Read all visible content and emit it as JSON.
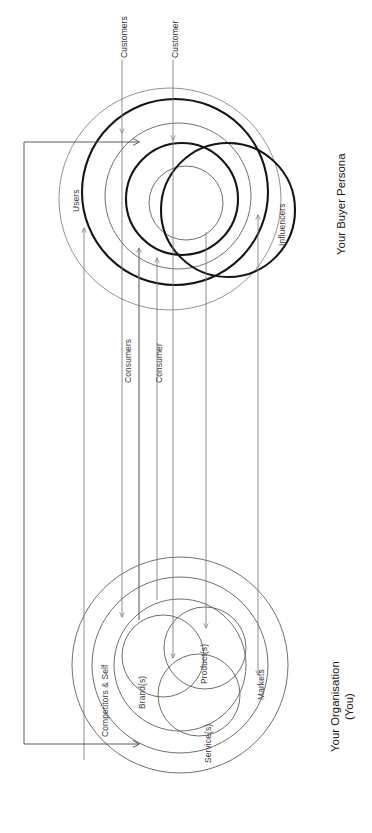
{
  "diagram": {
    "title_upper": "Your Buyer Persona",
    "title_lower_line1": "Your Organisation",
    "title_lower_line2": "(You)",
    "orientation": "rotated-90-counterclockwise",
    "stroke_color": "#1b1b1b",
    "thin_stroke_color": "#6f6f6f",
    "arrow_color": "#7a7a7a",
    "background": "#ffffff"
  },
  "buyer_persona": {
    "outer_ring_label": "Users",
    "rings": [
      {
        "label": "Users",
        "weight": "thin"
      },
      {
        "label": "Customers",
        "weight": "bold"
      },
      {
        "label": "Consumers",
        "weight": "thin"
      },
      {
        "label": "Customer",
        "weight": "bold"
      },
      {
        "label": "Consumer",
        "weight": "thin"
      },
      {
        "label": "Influencers",
        "weight": "bold"
      }
    ],
    "labels": {
      "users": "Users",
      "customers": "Customers",
      "customer": "Customer",
      "consumers": "Consumers",
      "consumer": "Consumer",
      "influencers": "Influencers"
    }
  },
  "organisation": {
    "labels": {
      "markets": "Markets",
      "competitors_and_self": "Competitors & Self",
      "brands": "Brand(s)",
      "products": "Product(s)",
      "services": "Service(s)"
    },
    "rings": [
      {
        "label": "Markets",
        "weight": "thin"
      },
      {
        "label": "Competitors & Self",
        "weight": "thin"
      },
      {
        "label": "Brand(s)",
        "weight": "thin"
      },
      {
        "label": "Product(s)",
        "weight": "thin"
      },
      {
        "label": "Service(s)",
        "weight": "thin"
      }
    ]
  },
  "connectors": [
    {
      "from": "Customers",
      "to": "Competitors & Self",
      "direction": "down"
    },
    {
      "from": "Customer",
      "to": "Brand(s)",
      "direction": "down"
    },
    {
      "from": "Consumers",
      "to": "Product(s)",
      "direction": "up"
    },
    {
      "from": "Consumer",
      "to": "Service(s)",
      "direction": "up"
    },
    {
      "from": "Influencers",
      "to": "Markets",
      "direction": "up"
    },
    {
      "from": "Users",
      "to": "organisation",
      "direction": "up"
    },
    {
      "from": "Your Organisation",
      "to": "Your Buyer Persona",
      "direction": "feedback-loop"
    }
  ]
}
